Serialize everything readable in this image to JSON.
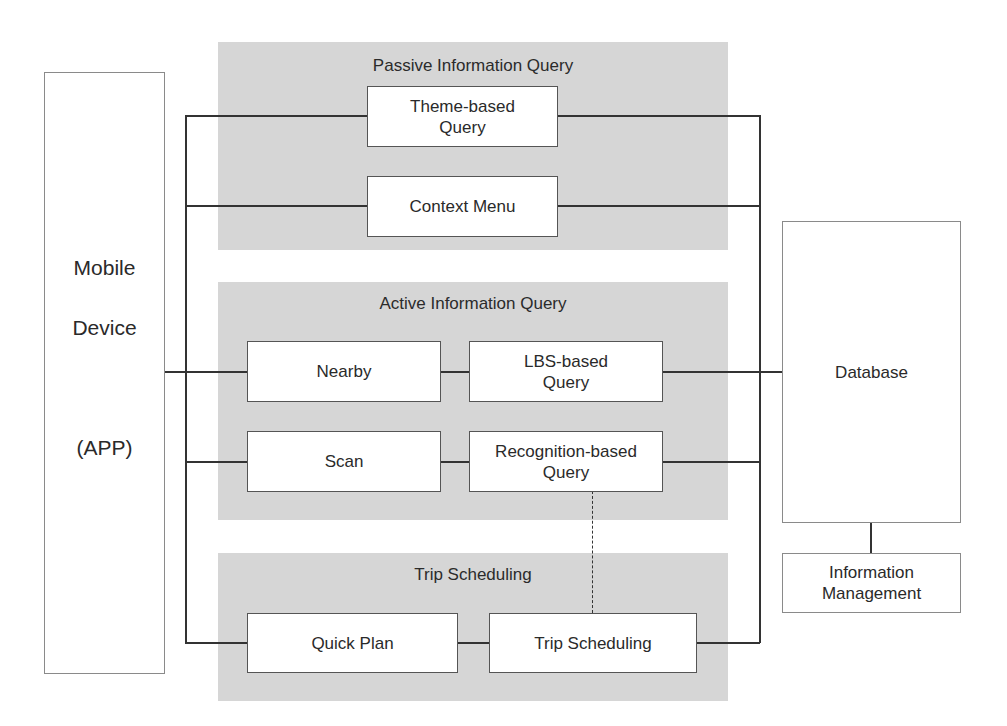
{
  "diagram": {
    "mobile_device": {
      "label_line1": "Mobile",
      "label_line2": "Device",
      "label_line3": "(APP)"
    },
    "database": {
      "label": "Database"
    },
    "information_management": {
      "label": "Information\nManagement"
    },
    "panels": {
      "passive": {
        "title": "Passive Information Query",
        "boxes": [
          {
            "label": "Theme-based\nQuery"
          },
          {
            "label": "Context Menu"
          }
        ]
      },
      "active": {
        "title": "Active Information Query",
        "boxes": [
          {
            "label": "Nearby"
          },
          {
            "label": "LBS-based\nQuery"
          },
          {
            "label": "Scan"
          },
          {
            "label": "Recognition-based\nQuery"
          }
        ]
      },
      "trip": {
        "title": "Trip Scheduling",
        "boxes": [
          {
            "label": "Quick Plan"
          },
          {
            "label": "Trip Scheduling"
          }
        ]
      }
    },
    "colors": {
      "panel_fill": "#d6d6d6",
      "line": "#333333",
      "box_fill": "#ffffff"
    }
  }
}
